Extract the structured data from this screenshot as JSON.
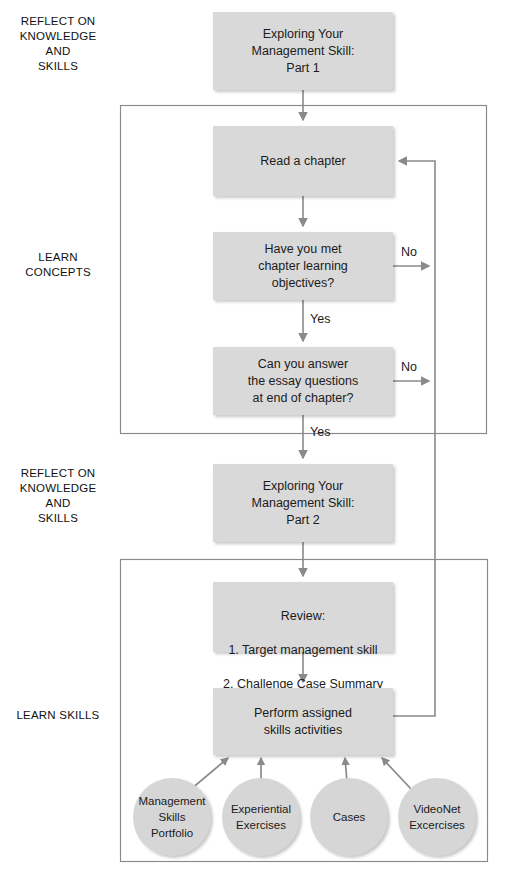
{
  "diagram": {
    "colors": {
      "box_fill": "#d9d9d9",
      "circle_fill": "#d6d6d6",
      "line": "#8a8a8a",
      "text": "#1b1b1b",
      "background": "#ffffff"
    },
    "phase_labels": [
      {
        "id": "reflect-top",
        "text": "REFLECT ON\nKNOWLEDGE\nAND\nSKILLS"
      },
      {
        "id": "learn-concepts",
        "text": "LEARN\nCONCEPTS"
      },
      {
        "id": "reflect-mid",
        "text": "REFLECT ON\nKNOWLEDGE\nAND\nSKILLS"
      },
      {
        "id": "learn-skills",
        "text": "LEARN SKILLS"
      }
    ],
    "boxes": [
      {
        "id": "exploring-part-1",
        "text": "Exploring Your\nManagement Skill:\nPart 1"
      },
      {
        "id": "read-a-chapter",
        "text": "Read a chapter"
      },
      {
        "id": "met-objectives",
        "text": "Have you met\nchapter learning\nobjectives?"
      },
      {
        "id": "answer-essay",
        "text": "Can you answer\nthe essay questions\nat end of chapter?"
      },
      {
        "id": "exploring-part-2",
        "text": "Exploring Your\nManagement Skill:\nPart 2"
      },
      {
        "id": "review",
        "title": "Review:",
        "items": [
          "1. Target management skill",
          "2. Challenge Case Summary"
        ]
      },
      {
        "id": "perform-skills",
        "text": "Perform assigned\nskills activities"
      }
    ],
    "circles": [
      {
        "id": "management-skills-portfolio",
        "text": "Management\nSkills\nPortfolio"
      },
      {
        "id": "experiential-exercises",
        "text": "Experiential\nExercises"
      },
      {
        "id": "cases",
        "text": "Cases"
      },
      {
        "id": "videonet-excercises",
        "text": "VideoNet\nExcercises"
      }
    ],
    "edge_labels": [
      {
        "id": "no-objectives",
        "text": "No"
      },
      {
        "id": "yes-objectives",
        "text": "Yes"
      },
      {
        "id": "no-essay",
        "text": "No"
      },
      {
        "id": "yes-essay",
        "text": "Yes"
      }
    ]
  }
}
